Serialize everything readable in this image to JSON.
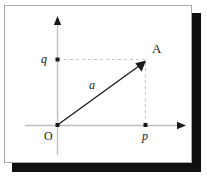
{
  "figure": {
    "kind": "vector-diagram",
    "panel": {
      "background": "#ffffff",
      "border_color": "#a9a9a9",
      "shadow_color": "#101010"
    },
    "colors": {
      "axis": "#b9b9b9",
      "arrowhead": "#1a1a1a",
      "vector": "#1a1a1a",
      "dashed": "#c4c4c4",
      "dot": "#1a1a1a",
      "text": "#1a1a1a"
    },
    "labels": {
      "origin": "O",
      "x_coordinate": "p",
      "y_coordinate": "q",
      "point": "A",
      "vector": "a"
    },
    "geometry": {
      "origin": [
        57,
        125
      ],
      "point_A": [
        145,
        61
      ],
      "x_axis": [
        25,
        125,
        185,
        125
      ],
      "y_axis": [
        57,
        155,
        57,
        16
      ],
      "p_marker": [
        145,
        125
      ],
      "q_marker": [
        57,
        59
      ]
    }
  }
}
